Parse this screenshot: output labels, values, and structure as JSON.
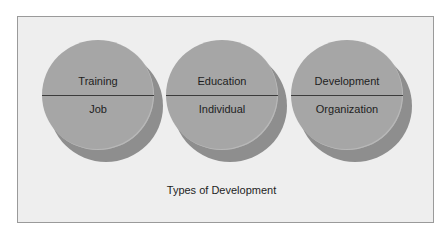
{
  "diagram": {
    "caption": "Types of Development",
    "discs": [
      {
        "top_label": "Training",
        "bottom_label": "Job"
      },
      {
        "top_label": "Education",
        "bottom_label": "Individual"
      },
      {
        "top_label": "Development",
        "bottom_label": "Organization"
      }
    ],
    "colors": {
      "panel_bg": "#eeeeee",
      "panel_border": "#9a9a9a",
      "disc_front": "#a6a6a6",
      "disc_shadow": "#8e8e8e",
      "divider": "#3c3c3c",
      "text": "#1e1e1e"
    }
  }
}
